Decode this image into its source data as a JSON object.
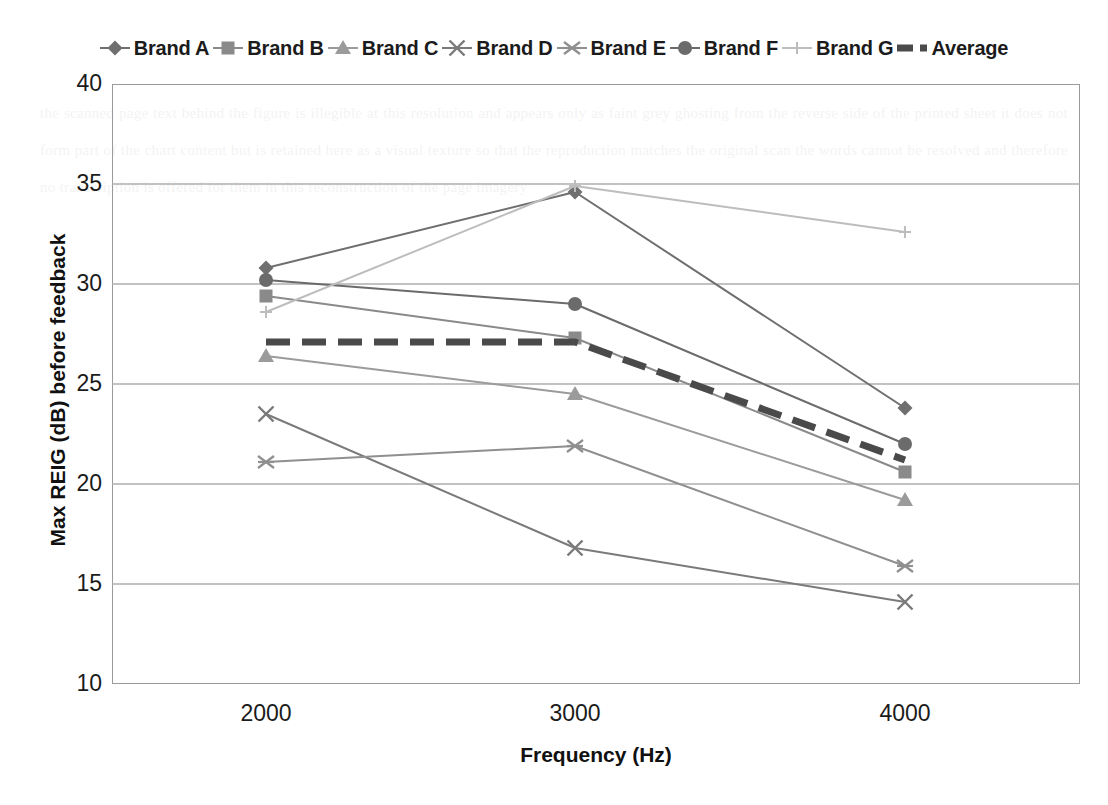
{
  "chart_data": {
    "type": "line",
    "title": "",
    "xlabel": "Frequency (Hz)",
    "ylabel": "Max REIG (dB) before feedback",
    "categories": [
      "2000",
      "3000",
      "4000"
    ],
    "x": [
      2000,
      3000,
      4000
    ],
    "ylim": [
      10,
      40
    ],
    "yticks": [
      10,
      15,
      20,
      25,
      30,
      35,
      40
    ],
    "grid": "horizontal",
    "legend_position": "top",
    "series": [
      {
        "name": "Brand A",
        "values": [
          30.8,
          34.6,
          23.8
        ],
        "marker": "diamond",
        "color": "#6f6f6f",
        "line_width": 2,
        "line_style": "solid"
      },
      {
        "name": "Brand B",
        "values": [
          29.4,
          27.3,
          20.6
        ],
        "marker": "square",
        "color": "#8a8a8a",
        "line_width": 2,
        "line_style": "solid"
      },
      {
        "name": "Brand C",
        "values": [
          26.4,
          24.5,
          19.2
        ],
        "marker": "triangle",
        "color": "#9b9b9b",
        "line_width": 2,
        "line_style": "solid"
      },
      {
        "name": "Brand D",
        "values": [
          23.5,
          16.8,
          14.1
        ],
        "marker": "cross-x",
        "color": "#7a7a7a",
        "line_width": 2,
        "line_style": "solid"
      },
      {
        "name": "Brand E",
        "values": [
          21.1,
          21.9,
          15.9
        ],
        "marker": "asterisk",
        "color": "#8f8f8f",
        "line_width": 2,
        "line_style": "solid"
      },
      {
        "name": "Brand F",
        "values": [
          30.2,
          29.0,
          22.0
        ],
        "marker": "circle",
        "color": "#6b6b6b",
        "line_width": 2,
        "line_style": "solid"
      },
      {
        "name": "Brand G",
        "values": [
          28.6,
          34.9,
          32.6
        ],
        "marker": "plus",
        "color": "#bdbdbd",
        "line_width": 2,
        "line_style": "solid"
      },
      {
        "name": "Average",
        "values": [
          27.1,
          27.1,
          21.2
        ],
        "marker": "none",
        "color": "#4a4a4a",
        "line_width": 7,
        "line_style": "dashed"
      }
    ]
  },
  "axis": {
    "y_tick_labels": [
      "40",
      "35",
      "30",
      "25",
      "20",
      "15",
      "10"
    ],
    "x_tick_labels": [
      "2000",
      "3000",
      "4000"
    ],
    "x_title": "Frequency (Hz)",
    "y_title": "Max REIG (dB) before feedback"
  },
  "legend": {
    "entries": [
      {
        "label": "Brand A"
      },
      {
        "label": "Brand B"
      },
      {
        "label": "Brand C"
      },
      {
        "label": "Brand D"
      },
      {
        "label": "Brand E"
      },
      {
        "label": "Brand F"
      },
      {
        "label": "Brand G"
      },
      {
        "label": "Average"
      }
    ]
  },
  "background": {
    "bleed_text": "the scanned page text behind the figure is illegible at this resolution and appears only as faint grey ghosting from the reverse side of the printed sheet it does not form part of the chart content but is retained here as a visual texture so that the reproduction matches the original scan the words cannot be resolved and therefore no transcription is offered for them in this reconstruction of the page imagery"
  }
}
